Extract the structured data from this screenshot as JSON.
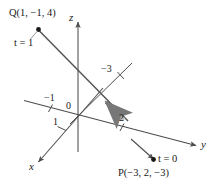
{
  "figure": {
    "colors": {
      "ink": "#1a1a1a",
      "axis": "#4d4d4d",
      "line": "#555555",
      "vector_arrow": "#8a8a8a",
      "background": "#ffffff"
    },
    "axes": [
      {
        "name": "x",
        "label": "x",
        "direction": "down-left"
      },
      {
        "name": "y",
        "label": "y",
        "direction": "right"
      },
      {
        "name": "z",
        "label": "z",
        "direction": "up"
      }
    ],
    "origin_label": "0",
    "tick_labels": [
      {
        "name": "tick-neg-one-y",
        "text": "−1"
      },
      {
        "name": "tick-one-x",
        "text": "1"
      },
      {
        "name": "tick-two-y",
        "text": "2"
      },
      {
        "name": "tick-neg-three-z",
        "text": "−3"
      }
    ],
    "points": [
      {
        "name": "point-q",
        "label": "Q(1, −1, 4)",
        "parameter": "t = 1"
      },
      {
        "name": "point-p",
        "label": "P(−3, 2, −3)",
        "parameter": "t = 0"
      }
    ],
    "direction_vector": {
      "name": "direction-vector-arrow",
      "points_toward": "Q"
    }
  }
}
